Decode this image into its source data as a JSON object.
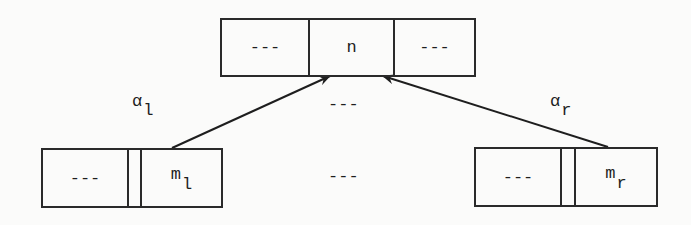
{
  "diagram": {
    "top_node": {
      "left": "---",
      "center": "n",
      "right": "---"
    },
    "left_node": {
      "left": "---",
      "name": "m",
      "subscript": "l"
    },
    "right_node": {
      "left": "---",
      "name": "m",
      "subscript": "r"
    },
    "edges": [
      {
        "from": "left_node",
        "to": "top_node",
        "label": "α",
        "label_subscript": "l"
      },
      {
        "from": "right_node",
        "to": "top_node",
        "label": "α",
        "label_subscript": "r"
      }
    ],
    "between_top": "---",
    "between_bottom": "---"
  }
}
